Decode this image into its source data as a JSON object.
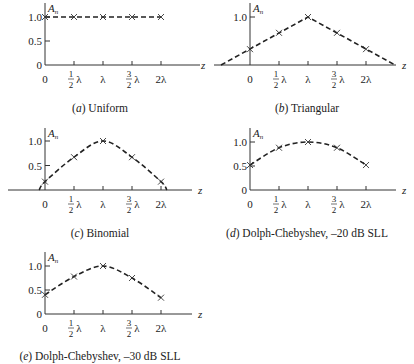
{
  "figure": {
    "y_axis_label": "A",
    "y_axis_label_sub": "n",
    "x_axis_label": "z",
    "x_tick_labels": [
      "0",
      "1/2 λ",
      "λ",
      "3/2 λ",
      "2λ"
    ],
    "y_tick_labels": [
      "0",
      "0.5",
      "1.0"
    ]
  },
  "chart_data": [
    {
      "type": "line",
      "panel": "a",
      "title": "(a) Uniform",
      "caption_letter": "a",
      "caption_text": "Uniform",
      "xlabel": "z",
      "ylabel": "A_n",
      "x": [
        "0",
        "1/2 λ",
        "λ",
        "3/2 λ",
        "2λ"
      ],
      "x_numeric": [
        0,
        0.5,
        1.0,
        1.5,
        2.0
      ],
      "values": [
        1.0,
        1.0,
        1.0,
        1.0,
        1.0
      ],
      "y_ticks": [
        0,
        0.5,
        1.0
      ],
      "ylim": [
        0,
        1.1
      ],
      "markers": "x",
      "line_style": "dashed",
      "grid": false
    },
    {
      "type": "line",
      "panel": "b",
      "title": "(b) Triangular",
      "caption_letter": "b",
      "caption_text": "Triangular",
      "xlabel": "z",
      "ylabel": "A_n",
      "x": [
        "0",
        "1/2 λ",
        "λ",
        "3/2 λ",
        "2λ"
      ],
      "x_numeric": [
        0,
        0.5,
        1.0,
        1.5,
        2.0
      ],
      "values": [
        0.33,
        0.67,
        1.0,
        0.67,
        0.33
      ],
      "curve_extends_to_zero": [
        -0.5,
        2.5
      ],
      "y_ticks": [
        1.0
      ],
      "ylim": [
        0,
        1.1
      ],
      "markers": "x",
      "line_style": "dashed",
      "grid": false
    },
    {
      "type": "line",
      "panel": "c",
      "title": "(c) Binomial",
      "caption_letter": "c",
      "caption_text": "Binomial",
      "xlabel": "z",
      "ylabel": "A_n",
      "x": [
        "0",
        "1/2 λ",
        "λ",
        "3/2 λ",
        "2λ"
      ],
      "x_numeric": [
        0,
        0.5,
        1.0,
        1.5,
        2.0
      ],
      "values": [
        0.17,
        0.67,
        1.0,
        0.67,
        0.17
      ],
      "curve_extends_to_zero": [
        -0.1,
        2.1
      ],
      "y_ticks": [
        0.5,
        1.0
      ],
      "ylim": [
        0,
        1.1
      ],
      "markers": "x",
      "line_style": "dashed",
      "grid": false
    },
    {
      "type": "line",
      "panel": "d",
      "title": "(d) Dolph-Chebyshev, –20 dB SLL",
      "caption_letter": "d",
      "caption_text": "Dolph-Chebyshev, –20 dB SLL",
      "xlabel": "z",
      "ylabel": "A_n",
      "x": [
        "0",
        "1/2 λ",
        "λ",
        "3/2 λ",
        "2λ"
      ],
      "x_numeric": [
        0,
        0.5,
        1.0,
        1.5,
        2.0
      ],
      "values": [
        0.52,
        0.88,
        1.0,
        0.88,
        0.52
      ],
      "y_ticks": [
        0,
        0.5,
        1.0
      ],
      "ylim": [
        0,
        1.1
      ],
      "markers": "x",
      "line_style": "dashed",
      "grid": false
    },
    {
      "type": "line",
      "panel": "e",
      "title": "(e) Dolph-Chebyshev, –30 dB SLL",
      "caption_letter": "e",
      "caption_text": "Dolph-Chebyshev, –30 dB SLL",
      "xlabel": "z",
      "ylabel": "A_n",
      "x": [
        "0",
        "1/2 λ",
        "λ",
        "3/2 λ",
        "2λ"
      ],
      "x_numeric": [
        0,
        0.5,
        1.0,
        1.5,
        2.0
      ],
      "values": [
        0.4,
        0.78,
        1.0,
        0.75,
        0.34
      ],
      "y_ticks": [
        0,
        0.5,
        1.0
      ],
      "ylim": [
        0,
        1.1
      ],
      "markers": "x",
      "line_style": "dashed",
      "grid": false
    }
  ]
}
